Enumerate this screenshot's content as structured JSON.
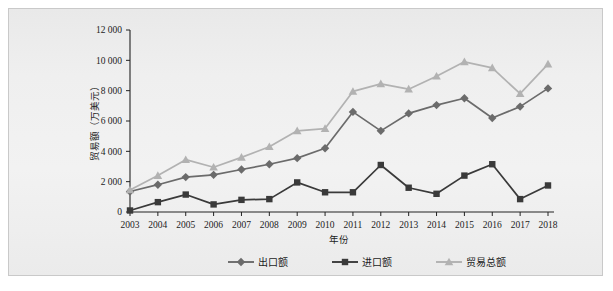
{
  "chart_data": {
    "type": "line",
    "title": "",
    "xlabel": "年份",
    "ylabel": "贸易额（万美元）",
    "categories": [
      "2003",
      "2004",
      "2005",
      "2006",
      "2007",
      "2008",
      "2009",
      "2010",
      "2011",
      "2012",
      "2013",
      "2014",
      "2015",
      "2016",
      "2017",
      "2018"
    ],
    "ylim": [
      0,
      12000
    ],
    "yticks": [
      "0",
      "2 000",
      "4 000",
      "6 000",
      "8 000",
      "10 000",
      "12 000"
    ],
    "ytick_values": [
      0,
      2000,
      4000,
      6000,
      8000,
      10000,
      12000
    ],
    "grid": false,
    "legend_position": "bottom",
    "series": [
      {
        "name": "出口额",
        "marker": "diamond",
        "color": "#6b6b6b",
        "values": [
          1350,
          1800,
          2300,
          2450,
          2800,
          3150,
          3550,
          4200,
          6600,
          5350,
          6500,
          7050,
          7500,
          6200,
          6950,
          8150
        ]
      },
      {
        "name": "进口额",
        "marker": "square",
        "color": "#3a3a3a",
        "values": [
          100,
          650,
          1150,
          500,
          800,
          850,
          1950,
          1300,
          1300,
          3100,
          1600,
          1200,
          2400,
          3150,
          850,
          1750
        ]
      },
      {
        "name": "贸易总额",
        "marker": "triangle",
        "color": "#b2b2b2",
        "values": [
          1450,
          2400,
          3450,
          2950,
          3600,
          4300,
          5350,
          5500,
          7950,
          8450,
          8100,
          8950,
          9900,
          9500,
          7800,
          9750
        ]
      }
    ]
  }
}
